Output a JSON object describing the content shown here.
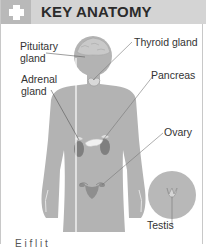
{
  "header": {
    "title": "KEY ANATOMY",
    "icon": "plus-icon"
  },
  "labels": {
    "pituitary": "Pituitary\ngland",
    "pituitary_line1": "Pituitary",
    "pituitary_line2": "gland",
    "thyroid": "Thyroid gland",
    "adrenal_line1": "Adrenal",
    "adrenal_line2": "gland",
    "pancreas": "Pancreas",
    "ovary": "Ovary",
    "testis": "Testis"
  },
  "footer": {
    "text": "E                    i  f         l i           t"
  },
  "colors": {
    "header_bg": "#d4d4d4",
    "icon_bg": "#b9b9b9",
    "body_fill": "#b3b3b3",
    "organ_dark": "#8a8a8a",
    "leader_line": "#777777"
  }
}
